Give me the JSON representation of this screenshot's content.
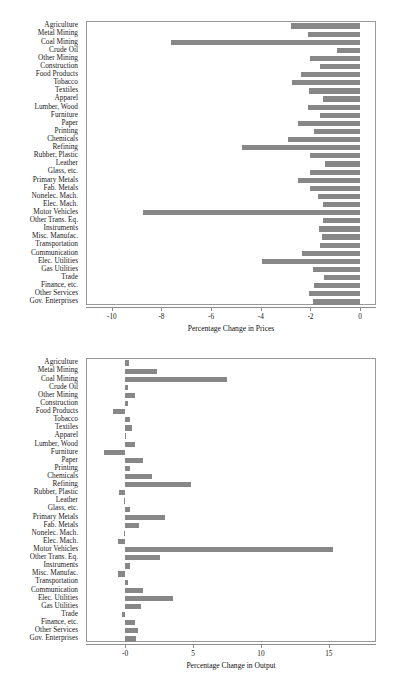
{
  "figure": {
    "background_color": "#ffffff",
    "bar_color": "#878787",
    "frame_color": "#9a9a9a"
  },
  "chart_data": [
    {
      "id": "prices",
      "type": "bar",
      "orientation": "horizontal",
      "title": "",
      "xlabel": "Percentage Change in Prices",
      "ylabel": "",
      "xlim": [
        -11.0,
        0.6
      ],
      "xticks": [
        -10,
        -8,
        -6,
        -4,
        -2,
        0
      ],
      "xtick_labels": [
        "-10",
        "-8",
        "-6",
        "-4",
        "-2",
        "0"
      ],
      "grid": false,
      "legend": "none",
      "categories": [
        "Agriculture",
        "Metal Mining",
        "Coal Mining",
        "Crude Oil",
        "Other Mining",
        "Construction",
        "Food Products",
        "Tobacco",
        "Textiles",
        "Apparel",
        "Lumber, Wood",
        "Furniture",
        "Paper",
        "Printing",
        "Chemicals",
        "Refining",
        "Rubber, Plastic",
        "Leather",
        "Glass, etc.",
        "Primary Metals",
        "Fab. Metals",
        "Nonelec. Mach.",
        "Elec. Mach.",
        "Motor Vehicles",
        "Other Trans. Eq.",
        "Instruments",
        "Misc. Manufac.",
        "Transportation",
        "Communication",
        "Elec. Utilities",
        "Gas Utilities",
        "Trade",
        "Finance, etc.",
        "Other Services",
        "Gov. Enterprises"
      ],
      "values": [
        -2.8,
        -2.1,
        -7.6,
        -0.95,
        -2.0,
        -1.6,
        -2.4,
        -2.75,
        -2.05,
        -1.5,
        -2.1,
        -1.6,
        -2.5,
        -1.85,
        -2.9,
        -4.75,
        -2.0,
        -1.4,
        -2.0,
        -2.5,
        -2.0,
        -1.7,
        -1.5,
        -8.75,
        -1.5,
        -1.65,
        -1.55,
        -1.6,
        -2.35,
        -3.95,
        -1.9,
        -1.45,
        -1.85,
        -2.05,
        -1.9
      ]
    },
    {
      "id": "output",
      "type": "bar",
      "orientation": "horizontal",
      "title": "",
      "xlabel": "Percentage Change in Output",
      "ylabel": "",
      "xlim": [
        -2.8,
        18.4
      ],
      "xticks": [
        0,
        5,
        10,
        15
      ],
      "xtick_labels": [
        "-0",
        "5",
        "10",
        "15"
      ],
      "grid": false,
      "legend": "none",
      "categories": [
        "Agriculture",
        "Metal Mining",
        "Coal Mining",
        "Crude Oil",
        "Other Mining",
        "Construction",
        "Food Products",
        "Tobacco",
        "Textiles",
        "Apparel",
        "Lumber, Wood",
        "Furniture",
        "Paper",
        "Printing",
        "Chemicals",
        "Refining",
        "Rubber, Plastic",
        "Leather",
        "Glass, etc.",
        "Primary Metals",
        "Fab. Metals",
        "Nonelec. Mach.",
        "Elec. Mach.",
        "Motor Vehicles",
        "Other Trans. Eq.",
        "Instruments",
        "Misc. Manufac.",
        "Transportation",
        "Communication",
        "Elec. Utilities",
        "Gas Utilities",
        "Trade",
        "Finance, etc.",
        "Other Services",
        "Gov. Enterprises"
      ],
      "values": [
        0.3,
        2.35,
        7.5,
        0.2,
        0.75,
        0.2,
        -0.85,
        0.4,
        0.5,
        0.05,
        0.75,
        -1.55,
        1.35,
        0.4,
        1.95,
        4.85,
        -0.45,
        -0.05,
        0.35,
        2.95,
        1.05,
        -0.05,
        -0.5,
        15.3,
        2.6,
        0.35,
        -0.5,
        0.25,
        1.35,
        3.55,
        1.2,
        -0.25,
        0.75,
        0.95,
        0.8
      ]
    }
  ]
}
